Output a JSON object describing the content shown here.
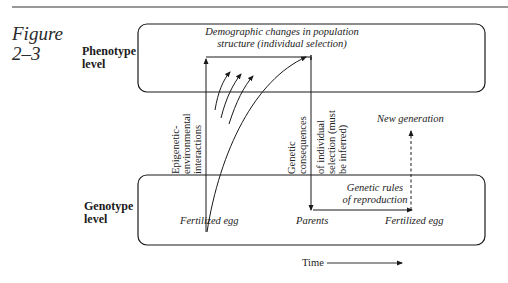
{
  "figure": {
    "label_line1": "Figure",
    "label_line2": "2–3"
  },
  "levels": {
    "phenotype": {
      "line1": "Phenotype",
      "line2": "level"
    },
    "genotype": {
      "line1": "Genotype",
      "line2": "level"
    }
  },
  "phenotype_box": {
    "title_line1": "Demographic changes in population",
    "title_line2": "structure (individual selection)"
  },
  "vertical_labels": {
    "epigenetic": [
      "Epigenetic-",
      "environmental",
      "interactions"
    ],
    "genetic_consequences": [
      "Genetic",
      "consequences",
      "of individual",
      "selection (must",
      "be inferred)"
    ]
  },
  "genotype_box": {
    "rules_line1": "Genetic rules",
    "rules_line2": "of reproduction",
    "fertilized_egg_left": "Fertilized egg",
    "parents": "Parents",
    "fertilized_egg_right": "Fertilized egg"
  },
  "new_generation": "New generation",
  "time_axis": {
    "label": "Time"
  },
  "colors": {
    "ink": "#1a1a1a",
    "background": "#ffffff"
  }
}
